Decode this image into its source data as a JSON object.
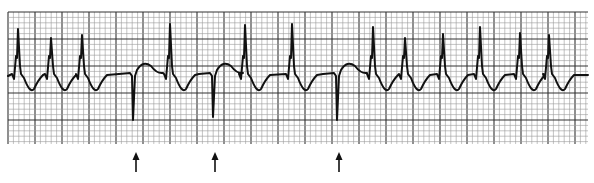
{
  "figure": {
    "type": "ecg-rhythm-strip",
    "width": 594,
    "height": 183,
    "colors": {
      "background": "#ffffff",
      "grid_minor": "#9a9a9a",
      "grid_major": "#333333",
      "trace": "#111111",
      "arrow": "#111111"
    },
    "grid": {
      "x0": 8,
      "y0": 12,
      "x1": 588,
      "y1": 144,
      "minor_px": 5.4,
      "major_every": 5
    },
    "baseline_y": 76,
    "beats": [
      {
        "x": 18,
        "peak": 29,
        "kind": "qrs"
      },
      {
        "x": 51,
        "peak": 38,
        "kind": "qrs"
      },
      {
        "x": 82,
        "peak": 35,
        "kind": "qrs"
      },
      {
        "x": 133,
        "trough": 120,
        "kind": "pacer-spike"
      },
      {
        "x": 170,
        "peak": 24,
        "kind": "qrs"
      },
      {
        "x": 213,
        "trough": 117,
        "kind": "pacer-spike"
      },
      {
        "x": 245,
        "peak": 25,
        "kind": "qrs"
      },
      {
        "x": 292,
        "peak": 24,
        "kind": "qrs"
      },
      {
        "x": 337,
        "trough": 120,
        "kind": "pacer-spike"
      },
      {
        "x": 373,
        "peak": 27,
        "kind": "qrs"
      },
      {
        "x": 405,
        "peak": 38,
        "kind": "qrs"
      },
      {
        "x": 443,
        "peak": 34,
        "kind": "qrs"
      },
      {
        "x": 480,
        "peak": 27,
        "kind": "qrs"
      },
      {
        "x": 520,
        "peak": 33,
        "kind": "qrs"
      },
      {
        "x": 549,
        "peak": 35,
        "kind": "qrs"
      }
    ],
    "arrows": [
      {
        "x": 136,
        "y_top": 152,
        "y_bottom": 172,
        "label": "arrow-1"
      },
      {
        "x": 215,
        "y_top": 152,
        "y_bottom": 172,
        "label": "arrow-2"
      },
      {
        "x": 339,
        "y_top": 152,
        "y_bottom": 172,
        "label": "arrow-3"
      }
    ]
  }
}
